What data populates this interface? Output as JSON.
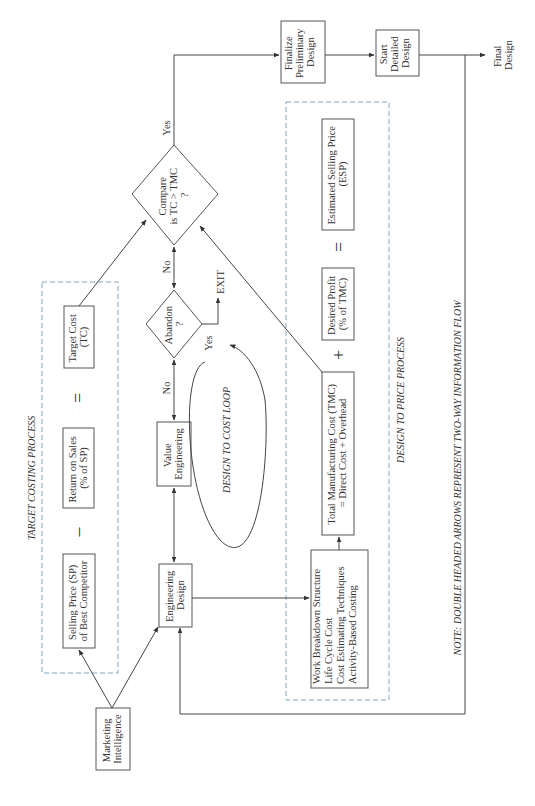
{
  "diagram": {
    "nodes": {
      "finalize_preliminary_design": [
        "Finalize",
        "Preliminary",
        "Design"
      ],
      "start_detailed_design": [
        "Start",
        "Detailed",
        "Design"
      ],
      "final_design": [
        "Final",
        "Design"
      ],
      "compare": [
        "Compare",
        "is TC > TMC",
        "?"
      ],
      "abandon": [
        "Abandon",
        "?"
      ],
      "exit": "EXIT",
      "value_engineering": [
        "Value",
        "Engineering"
      ],
      "engineering_design": [
        "Engineering",
        "Design"
      ],
      "marketing_intelligence": [
        "Marketing",
        "Intelligence"
      ],
      "target_cost": [
        "Target Cost",
        "(TC)"
      ],
      "return_on_sales": [
        "Return on Sales",
        "(% of SP)"
      ],
      "selling_price": [
        "Selling Price (SP)",
        "of Best Competitor"
      ],
      "tmc": [
        "Total Manufacturing Cost (TMC)",
        "= Direct Cost + Overhead"
      ],
      "desired_profit": [
        "Desired Profit",
        "(% of TMC)"
      ],
      "esp": [
        "Estimated Selling Price",
        "(ESP)"
      ],
      "work_breakdown": [
        "Work Breakdown Structure",
        "Life Cycle Cost",
        "Cost Estimating Techniques",
        "Activity-Based Costing"
      ]
    },
    "operators": {
      "tc_equals": "=",
      "tc_minus": "–",
      "price_plus": "+",
      "price_equals": "="
    },
    "edge_labels": {
      "yes_compare": "Yes",
      "no_compare": "No",
      "no_abandon": "No",
      "yes_abandon": "Yes"
    },
    "group_labels": {
      "target_costing": "TARGET  COSTING PROCESS",
      "design_to_price": "DESIGN TO PRICE PROCESS",
      "design_to_cost_loop": "DESIGN TO COST LOOP"
    },
    "note": "NOTE: DOUBLE HEADED ARROWS REPRESENT TWO-WAY INFORMATION FLOW"
  }
}
